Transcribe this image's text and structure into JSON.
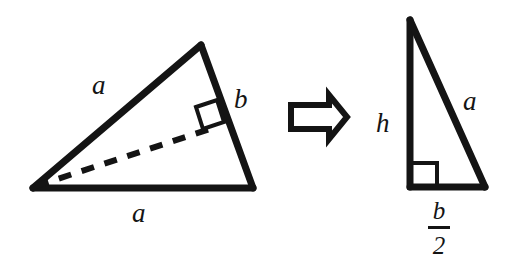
{
  "figure": {
    "background_color": "#ffffff",
    "stroke_color": "#141414",
    "left_triangle": {
      "side_upper_label": "a",
      "side_right_label": "b",
      "side_bottom_label": "a",
      "vertices": [
        [
          33,
          188
        ],
        [
          201,
          45
        ],
        [
          253,
          188
        ]
      ],
      "dashed_altitude": [
        [
          33,
          188
        ],
        [
          212,
          128
        ]
      ],
      "right_angle_marker": true
    },
    "transform_arrow": {
      "icon": "block-arrow-right-icon",
      "direction": "right",
      "style": "outlined"
    },
    "right_triangle": {
      "side_vertical_label": "h",
      "side_hypotenuse_label": "a",
      "base_label_numerator": "b",
      "base_label_denominator": "2",
      "vertices": [
        [
          410,
          20
        ],
        [
          410,
          187
        ],
        [
          485,
          187
        ]
      ],
      "right_angle_marker": true
    }
  }
}
